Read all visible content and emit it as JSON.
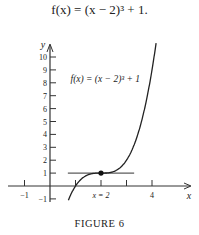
{
  "equation": "f(x) = (x − 2)³ + 1.",
  "caption": "FIGURE 6",
  "chart_data": {
    "type": "line",
    "title": "f(x) = (x − 2)³ + 1",
    "function": "(x-2)^3+1",
    "xlabel": "x",
    "ylabel": "y",
    "x_ticks": [
      -1,
      1,
      2,
      3,
      4
    ],
    "x_tick_labels": [
      "−1",
      "x = 2",
      "4"
    ],
    "y_ticks": [
      -1,
      1,
      2,
      3,
      4,
      5,
      6,
      7,
      8,
      9,
      10
    ],
    "y_tick_labels": [
      "−1",
      "1",
      "2",
      "3",
      "4",
      "5",
      "6",
      "7",
      "8",
      "9",
      "10"
    ],
    "xlim": [
      -1.5,
      4.6
    ],
    "ylim": [
      -1.5,
      11
    ],
    "series": [
      {
        "name": "f(x) = (x − 2)³ + 1",
        "x": [
          0.7,
          1,
          1.5,
          2,
          2.5,
          3,
          3.5,
          4,
          4.1
        ],
        "y": [
          -1.2,
          0,
          0.875,
          1,
          1.125,
          2,
          4.375,
          9,
          10.3
        ]
      }
    ],
    "annotations": [
      {
        "type": "horizontal_tangent",
        "y": 1,
        "x_range": [
          0.7,
          3.3
        ]
      },
      {
        "type": "point",
        "x": 2,
        "y": 1
      },
      {
        "type": "label",
        "text": "f(x) = (x − 2)³ + 1",
        "x": 0.6,
        "y": 8.2
      }
    ],
    "grid": false
  }
}
